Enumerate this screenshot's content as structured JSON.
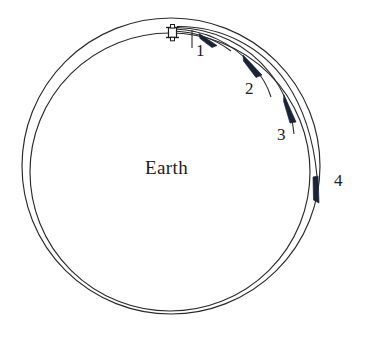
{
  "figure": {
    "type": "orbital-transfer-diagram",
    "background_color": "#ffffff",
    "line_color": "#2a2a2a",
    "arrow_color": "#1b2436",
    "text_color": "#1c1c1c"
  },
  "central_body": {
    "label": "Earth",
    "center_x": 172,
    "center_y": 168
  },
  "spacecraft": {
    "icon_name": "satellite-icon",
    "x": 172,
    "y": 32
  },
  "orbits": [
    {
      "name": "inner-orbit",
      "cx": 170,
      "cy": 172,
      "rx": 140,
      "ry": 139
    },
    {
      "name": "outer-orbit",
      "cx": 171,
      "cy": 166,
      "rx": 149,
      "ry": 148
    }
  ],
  "burn_labels": [
    {
      "id": "1",
      "text": "1",
      "x": 196,
      "y": 42
    },
    {
      "id": "2",
      "text": "2",
      "x": 245,
      "y": 80
    },
    {
      "id": "3",
      "text": "3",
      "x": 277,
      "y": 126
    },
    {
      "id": "4",
      "text": "4",
      "x": 334,
      "y": 172
    }
  ],
  "transfer_arcs": [
    {
      "id": "arc-1",
      "label": "1",
      "description": "first burn arc from spacecraft"
    },
    {
      "id": "arc-2",
      "label": "2",
      "description": "second burn arc"
    },
    {
      "id": "arc-3",
      "label": "3",
      "description": "third burn arc"
    },
    {
      "id": "arc-4",
      "label": "4",
      "description": "fourth burn arc to outer orbit"
    }
  ]
}
